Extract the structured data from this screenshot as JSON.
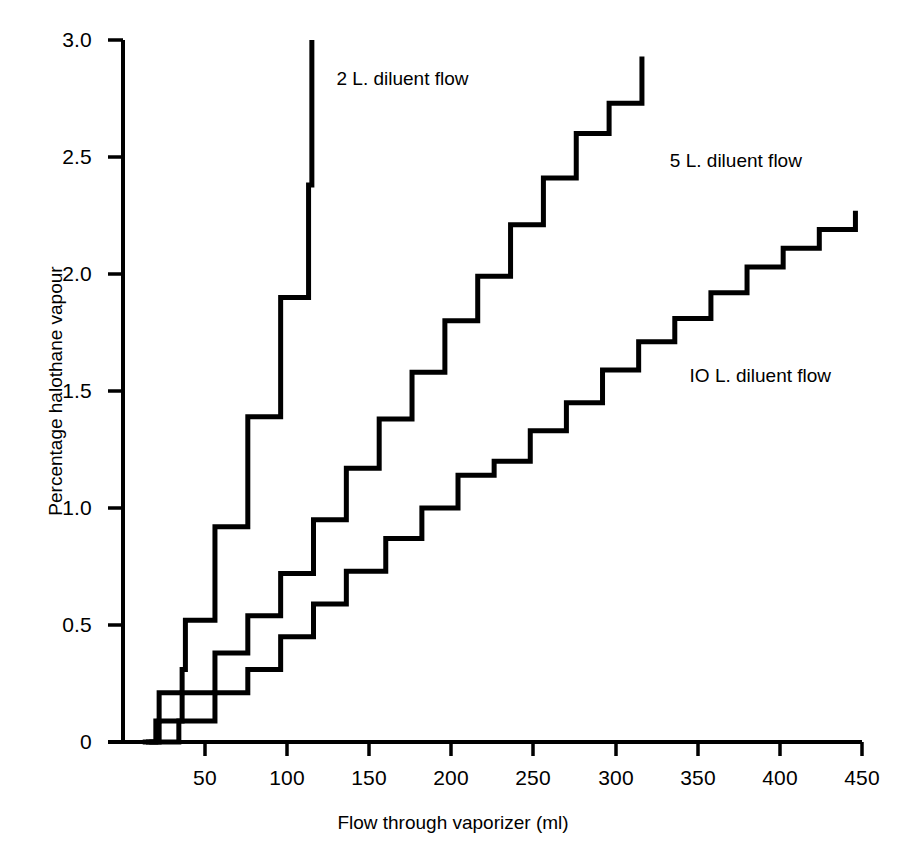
{
  "chart_data": {
    "type": "line",
    "title": "",
    "subtitle": "",
    "xlabel": "Flow through vaporizer (ml)",
    "ylabel": "Percentage halothane vapour",
    "xlim": [
      0,
      450
    ],
    "ylim": [
      0,
      3.1
    ],
    "grid": false,
    "legend_position": "inline-annotations",
    "xticks": [
      0,
      50,
      100,
      150,
      200,
      250,
      300,
      350,
      400,
      450
    ],
    "xtick_labels": [
      "0",
      "50",
      "100",
      "150",
      "200",
      "250",
      "300",
      "350",
      "400",
      "450"
    ],
    "yticks": [
      0,
      0.5,
      1.0,
      1.5,
      2.0,
      2.5,
      3.0
    ],
    "ytick_labels": [
      "0",
      "0.5",
      "1.0",
      "1.5",
      "2.0",
      "2.5",
      "3.0"
    ],
    "note": "Three staircase (step) curves of halothane vapour percentage versus vaporizer flow at three diluent flow rates.",
    "series": [
      {
        "name": "2 L. diluent flow",
        "label": "2 L. diluent flow",
        "label_x": 130,
        "label_y": 2.83,
        "step": "post",
        "x": [
          12,
          18,
          20,
          22,
          34,
          36,
          38,
          54,
          56,
          74,
          76,
          94,
          96,
          113,
          115
        ],
        "y": [
          0.0,
          0.0,
          0.09,
          0.21,
          0.21,
          0.31,
          0.52,
          0.52,
          0.92,
          0.92,
          1.39,
          1.39,
          1.9,
          2.38,
          3.0
        ]
      },
      {
        "name": "5 L. diluent flow",
        "label": "5 L. diluent flow",
        "label_x": 333,
        "label_y": 2.48,
        "step": "post",
        "x": [
          14,
          22,
          36,
          56,
          76,
          96,
          116,
          136,
          156,
          176,
          196,
          216,
          236,
          256,
          276,
          296,
          316
        ],
        "y": [
          0.0,
          0.09,
          0.21,
          0.38,
          0.54,
          0.72,
          0.95,
          1.17,
          1.38,
          1.58,
          1.8,
          1.99,
          2.21,
          2.41,
          2.6,
          2.73,
          2.93
        ]
      },
      {
        "name": "IO L. diluent flow",
        "label": "IO L. diluent flow",
        "label_x": 345,
        "label_y": 1.56,
        "step": "post",
        "x": [
          16,
          34,
          56,
          76,
          96,
          116,
          136,
          160,
          182,
          204,
          226,
          248,
          270,
          292,
          314,
          336,
          358,
          380,
          402,
          424,
          446
        ],
        "y": [
          0.0,
          0.09,
          0.21,
          0.31,
          0.45,
          0.59,
          0.73,
          0.87,
          1.0,
          1.14,
          1.2,
          1.33,
          1.45,
          1.59,
          1.71,
          1.81,
          1.92,
          2.03,
          2.11,
          2.19,
          2.27
        ]
      }
    ]
  },
  "axes": {
    "ytick_positions_px": [
      742,
      625,
      508,
      391,
      274,
      157,
      40
    ],
    "xtick_positions_px": [
      123,
      205,
      287,
      369,
      451,
      533,
      616,
      698,
      780,
      862
    ]
  },
  "colors": {
    "line": "#000000",
    "axis": "#000000",
    "background": "#ffffff"
  }
}
